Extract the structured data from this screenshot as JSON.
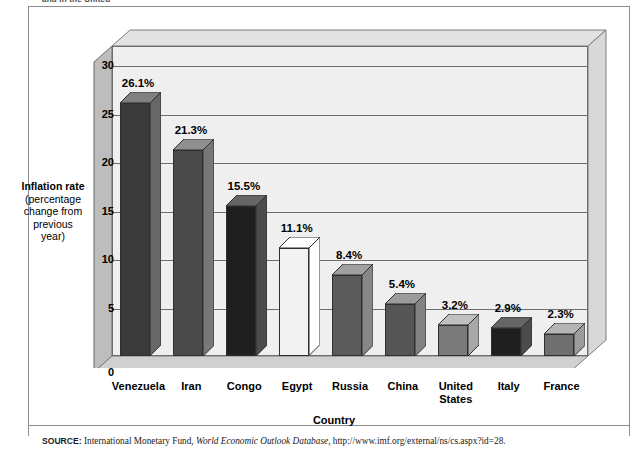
{
  "figure": {
    "caption": "and in the United"
  },
  "chart_data": {
    "type": "bar",
    "title": "",
    "subtitle": "",
    "xlabel": "Country",
    "ylabel": "Inflation rate (percentage change from previous year)",
    "ylabel_lines": [
      "Inflation rate",
      "(percentage",
      "change from",
      "previous",
      "year)"
    ],
    "categories": [
      "Venezuela",
      "Iran",
      "Congo",
      "Egypt",
      "Russia",
      "China",
      "United States",
      "Italy",
      "France"
    ],
    "category_lines": [
      [
        "Venezuela"
      ],
      [
        "Iran"
      ],
      [
        "Congo"
      ],
      [
        "Egypt"
      ],
      [
        "Russia"
      ],
      [
        "China"
      ],
      [
        "United",
        "States"
      ],
      [
        "Italy"
      ],
      [
        "France"
      ]
    ],
    "values": [
      26.1,
      21.3,
      15.5,
      11.1,
      8.4,
      5.4,
      3.2,
      2.9,
      2.3
    ],
    "value_labels": [
      "26.1%",
      "21.3%",
      "15.5%",
      "11.1%",
      "8.4%",
      "5.4%",
      "3.2%",
      "2.9%",
      "2.3%"
    ],
    "bar_colors": [
      "#3a3a3a",
      "#4a4a4a",
      "#1f1f1f",
      "#f2f2f2",
      "#5a5a5a",
      "#555555",
      "#7a7a7a",
      "#1f1f1f",
      "#6f6f6f"
    ],
    "ylim": [
      0,
      32
    ],
    "yticks": [
      0,
      5,
      10,
      15,
      20,
      25,
      30
    ],
    "ytick_labels": [
      "0",
      "5",
      "10",
      "15",
      "20",
      "25",
      "30"
    ],
    "grid": true,
    "grid_axis": "y",
    "legend": "none",
    "style": "3d-bar",
    "plot_background": "#efefef",
    "gridline_color": "#6f6f6f"
  },
  "source": {
    "label": "SOURCE:",
    "text_before": " International Monetary Fund, ",
    "italic": "World Economic Outlook Database",
    "text_after": ", http://www.imf.org/external/ns/cs.aspx?id=28."
  }
}
